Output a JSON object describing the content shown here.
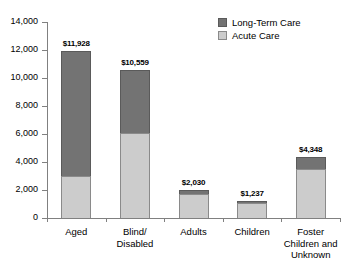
{
  "chart_data": {
    "type": "bar",
    "subtype": "stacked-bar",
    "title": "",
    "xlabel": "",
    "ylabel": "",
    "ylim": [
      0,
      14000
    ],
    "ytick_values": [
      0,
      2000,
      4000,
      6000,
      8000,
      10000,
      12000,
      14000
    ],
    "ytick_labels": [
      "0",
      "2,000",
      "4,000",
      "6,000",
      "8,000",
      "10,000",
      "12,000",
      "14,000"
    ],
    "grid": false,
    "legend_position": "top-right",
    "categories": [
      "Aged",
      "Blind/ Disabled",
      "Adults",
      "Children",
      "Foster Children and Unknown"
    ],
    "category_label_lines": [
      [
        "Aged"
      ],
      [
        "Blind/",
        "Disabled"
      ],
      [
        "Adults"
      ],
      [
        "Children"
      ],
      [
        "Foster",
        "Children and",
        "Unknown"
      ]
    ],
    "series": [
      {
        "name": "Acute Care",
        "color": "#cccccc",
        "values": [
          3000,
          6050,
          1730,
          1090,
          3480
        ]
      },
      {
        "name": "Long-Term Care",
        "color": "#737373",
        "values": [
          8928,
          4509,
          300,
          147,
          868
        ]
      }
    ],
    "totals": [
      11928,
      10559,
      2030,
      1237,
      4348
    ],
    "total_labels": [
      "$11,928",
      "$10,559",
      "$2,030",
      "$1,237",
      "$4,348"
    ]
  },
  "legend": {
    "items": [
      {
        "label": "Long-Term Care",
        "color": "#737373"
      },
      {
        "label": "Acute Care",
        "color": "#cccccc"
      }
    ]
  },
  "axis": {
    "y_labels": [
      "14,000",
      "12,000",
      "10,000",
      "8,000",
      "6,000",
      "4,000",
      "2,000",
      "0"
    ]
  }
}
